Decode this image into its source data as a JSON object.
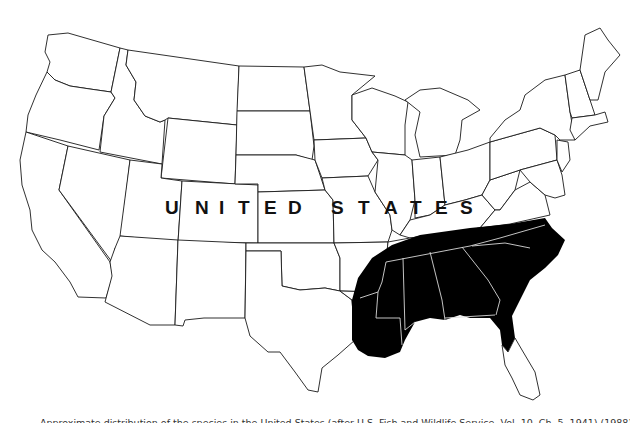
{
  "map": {
    "title": "UNITED STATES",
    "label_letters": [
      "U",
      "N",
      "I",
      "T",
      "E",
      "D",
      "S",
      "T",
      "A",
      "T",
      "E",
      "S"
    ],
    "label_x": [
      165,
      195,
      217,
      242,
      268,
      293,
      332,
      357,
      386,
      411,
      434,
      460
    ],
    "label_y": 214,
    "colors": {
      "background": "#ffffff",
      "state_outline": "#1a1a1a",
      "range_fill": "#000000",
      "range_internal_borders": "#d8d8d8"
    },
    "highlighted_region": {
      "description": "Shaded distribution range across the southeastern United States",
      "states": [
        "Louisiana",
        "Mississippi",
        "Alabama",
        "Georgia",
        "South Carolina",
        "North Carolina",
        "Tennessee (southern)",
        "Arkansas (southern)",
        "East Texas (fringe)",
        "North Florida"
      ]
    }
  },
  "caption": {
    "text": "Approximate distribution of the species in the United States (after U.S. Fish and Wildlife Service, Vol. 10, Ch. 5, 1941) (1988). Fig. 332."
  }
}
